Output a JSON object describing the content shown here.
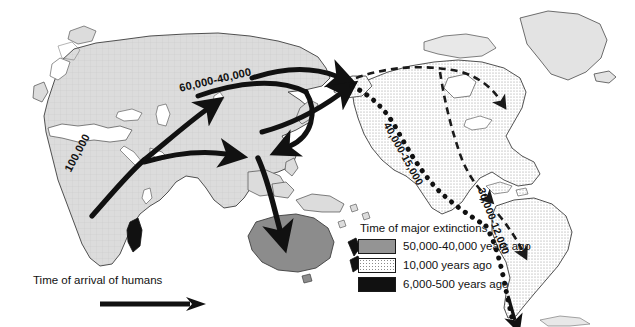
{
  "figure": {
    "type": "map"
  },
  "route_labels": [
    {
      "id": "africa-exit",
      "text": "100,000",
      "region": "Africa to Middle East"
    },
    {
      "id": "eurasia-north",
      "text": "60,000-40,000",
      "region": "Northern Eurasia"
    },
    {
      "id": "north-america-coast",
      "text": "40,000-15,000",
      "region": "North American Pacific coast"
    },
    {
      "id": "south-america-coast",
      "text": "30,000-12,000",
      "region": "South American Pacific coast"
    }
  ],
  "arrival_key": {
    "caption": "Time of arrival of humans",
    "arrow_icon": "right-arrow-icon"
  },
  "legend": {
    "title": "Time of major extinctions",
    "items": [
      {
        "swatch": "solid-gray",
        "color": "#949494",
        "label": "50,000-40,000 years ago"
      },
      {
        "swatch": "stippled-white",
        "color": "#ffffff",
        "label": "10,000 years ago"
      },
      {
        "swatch": "solid-black",
        "color": "#111111",
        "label": "6,000-500 years ago"
      }
    ]
  },
  "landmass_fills": {
    "eurasia_africa": "#d9d9d9",
    "americas_stipple": "#ffffff",
    "australia": "#8c8c8c",
    "madagascar": "#111111",
    "new_zealand": "#111111",
    "greenland": "#e3e3e3"
  }
}
